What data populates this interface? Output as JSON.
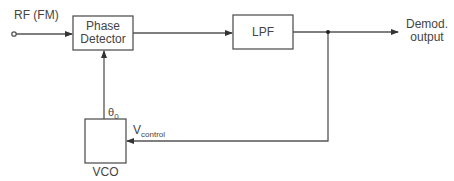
{
  "diagram": {
    "title": "",
    "input": {
      "label": "RF (FM)"
    },
    "blocks": {
      "phase_detector": {
        "line1": "Phase",
        "line2": "Detector"
      },
      "lpf": {
        "label": "LPF"
      },
      "vco": {
        "label": "VCO"
      }
    },
    "output": {
      "line1": "Demod.",
      "line2": "output"
    },
    "signals": {
      "theta": {
        "base": "θ",
        "sub": "0"
      },
      "vcontrol": {
        "base": "V",
        "sub": "control"
      }
    },
    "colors": {
      "line": "#444444",
      "background": "#ffffff"
    }
  }
}
